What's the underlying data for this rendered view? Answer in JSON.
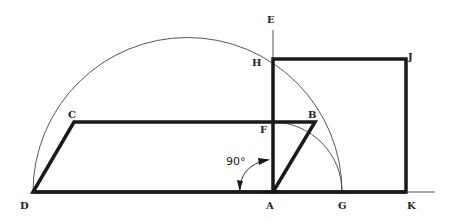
{
  "diagram": {
    "labels": {
      "A": "A",
      "B": "B",
      "C": "C",
      "D": "D",
      "E": "E",
      "F": "F",
      "G": "G",
      "H": "H",
      "J": "J",
      "K": "K"
    },
    "angle_label": "90°",
    "colors": {
      "stroke": "#1a1a1a",
      "thin": "#444444",
      "background": "#ffffff"
    },
    "points": {
      "D": [
        33,
        192
      ],
      "A": [
        273,
        192
      ],
      "G": [
        342,
        192
      ],
      "K": [
        407,
        192
      ],
      "C": [
        74,
        122
      ],
      "B": [
        315,
        122
      ],
      "F": [
        273,
        122
      ],
      "H": [
        273,
        59
      ],
      "J": [
        406,
        59
      ],
      "E": [
        273,
        30
      ]
    },
    "shapes": {
      "parallelogram": "ABCD",
      "square": "AHJK",
      "semicircle": "arc through D, H, G",
      "quarter_arc": "arc from F to G centered at A"
    }
  }
}
